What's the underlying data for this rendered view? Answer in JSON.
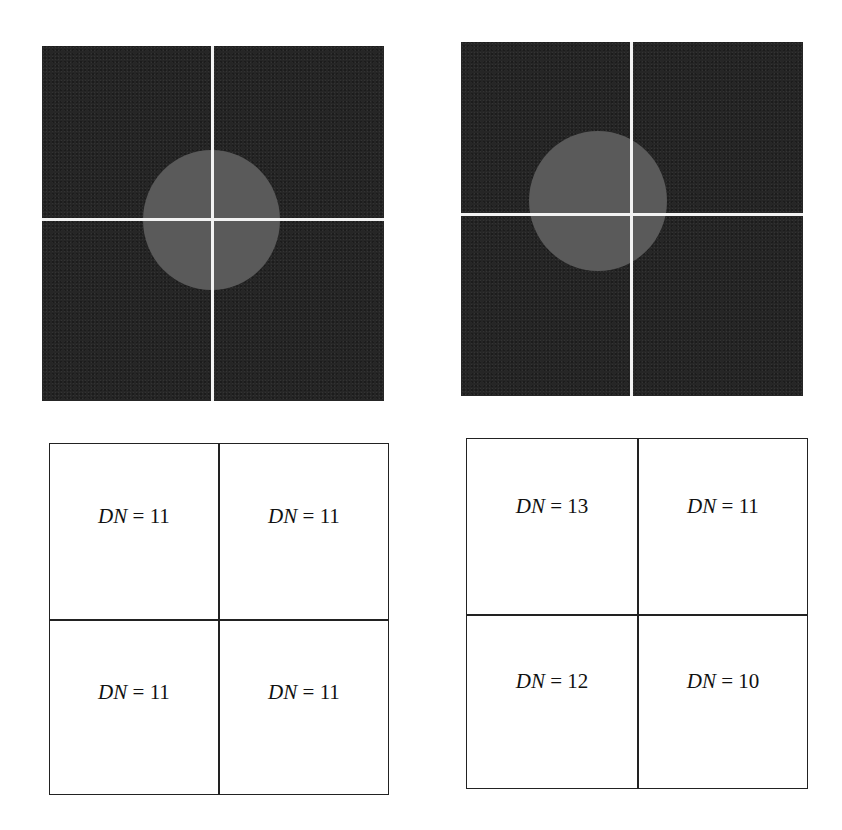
{
  "figure": {
    "top_left_image": {
      "description": "dark square image with bright disc centered on 2x2 pixel grid intersection",
      "background_color": "#262626",
      "disc_color": "#5a5a5a",
      "grid_line_color": "#f2f2f2"
    },
    "top_right_image": {
      "description": "dark square image with bright disc offset up-left of 2x2 pixel grid intersection",
      "background_color": "#262626",
      "disc_color": "#5a5a5a",
      "grid_line_color": "#f2f2f2"
    },
    "bottom_left_grid": {
      "cells": [
        {
          "var": "DN",
          "eq": " = ",
          "value": "11"
        },
        {
          "var": "DN",
          "eq": " = ",
          "value": "11"
        },
        {
          "var": "DN",
          "eq": " = ",
          "value": "11"
        },
        {
          "var": "DN",
          "eq": " = ",
          "value": "11"
        }
      ]
    },
    "bottom_right_grid": {
      "cells": [
        {
          "var": "DN",
          "eq": " = ",
          "value": "13"
        },
        {
          "var": "DN",
          "eq": " = ",
          "value": "11"
        },
        {
          "var": "DN",
          "eq": " = ",
          "value": "12"
        },
        {
          "var": "DN",
          "eq": " = ",
          "value": "10"
        }
      ]
    }
  }
}
